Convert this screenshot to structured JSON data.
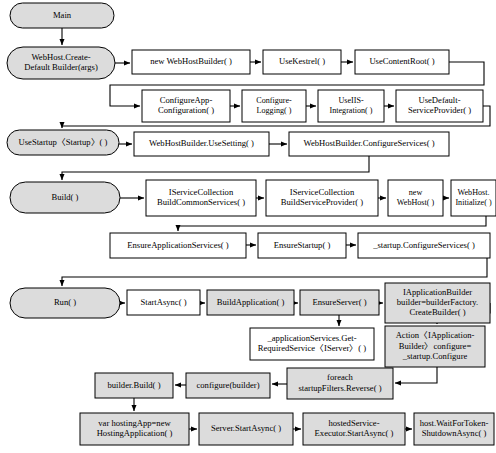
{
  "diagram": {
    "type": "flowchart",
    "colors": {
      "round_node_fill": "#dcdcdc",
      "rect_node_fill": "#ffffff",
      "highlight_node_fill": "#dcdcdc",
      "stroke": "#000000",
      "background": "#ffffff"
    },
    "nodes": [
      {
        "id": "main",
        "label": "Main",
        "shape": "rounded",
        "fill": "grey",
        "x": 10,
        "y": 3,
        "w": 104,
        "h": 25
      },
      {
        "id": "createdefault",
        "label": "WebHost.Create-\nDefault Builder(args)",
        "shape": "rounded",
        "fill": "grey",
        "x": 7,
        "y": 47,
        "w": 108,
        "h": 32
      },
      {
        "id": "usestartup",
        "label": "UseStartup〈Startup〉( )",
        "shape": "rounded",
        "fill": "grey",
        "x": 7,
        "y": 130,
        "w": 112,
        "h": 25
      },
      {
        "id": "build",
        "label": "Build( )",
        "shape": "rounded",
        "fill": "grey",
        "x": 10,
        "y": 182,
        "w": 110,
        "h": 31
      },
      {
        "id": "run",
        "label": "Run( )",
        "shape": "rounded",
        "fill": "grey",
        "x": 10,
        "y": 288,
        "w": 110,
        "h": 30
      },
      {
        "id": "newbuilder",
        "label": "new WebHostBuilder( )",
        "shape": "rect",
        "fill": "white",
        "x": 132,
        "y": 50,
        "w": 118,
        "h": 24
      },
      {
        "id": "usekestrel",
        "label": "UseKestrel( )",
        "shape": "rect",
        "fill": "white",
        "x": 263,
        "y": 50,
        "w": 78,
        "h": 24
      },
      {
        "id": "usecontentroot",
        "label": "UseContentRoot( )",
        "shape": "rect",
        "fill": "white",
        "x": 355,
        "y": 50,
        "w": 94,
        "h": 24
      },
      {
        "id": "configureapp",
        "label": "ConfigureApp-\nConfiguration( )",
        "shape": "rect",
        "fill": "white",
        "x": 142,
        "y": 90,
        "w": 88,
        "h": 32
      },
      {
        "id": "configurelog",
        "label": "Configure-\nLogging( )",
        "shape": "rect",
        "fill": "white",
        "x": 242,
        "y": 90,
        "w": 64,
        "h": 32
      },
      {
        "id": "useiis",
        "label": "UseIIS-\nIntegration( )",
        "shape": "rect",
        "fill": "white",
        "x": 318,
        "y": 90,
        "w": 66,
        "h": 32
      },
      {
        "id": "usedefaultsp",
        "label": "UseDefault-\nServiceProvider( )",
        "shape": "rect",
        "fill": "white",
        "x": 396,
        "y": 90,
        "w": 87,
        "h": 32
      },
      {
        "id": "usesetting",
        "label": "WebHostBuilder.UseSetting( )",
        "shape": "rect",
        "fill": "white",
        "x": 134,
        "y": 132,
        "w": 135,
        "h": 24
      },
      {
        "id": "bconfigureserv",
        "label": "WebHostBuilder.ConfigureServices( )",
        "shape": "rect",
        "fill": "white",
        "x": 289,
        "y": 132,
        "w": 160,
        "h": 24
      },
      {
        "id": "buildcommon",
        "label": "IServiceCollection\nBuildCommonServices( )",
        "shape": "rect",
        "fill": "white",
        "x": 146,
        "y": 180,
        "w": 110,
        "h": 36
      },
      {
        "id": "buildsp",
        "label": "IServiceCollection\nBuildServiceProvider( )",
        "shape": "rect",
        "fill": "white",
        "x": 266,
        "y": 180,
        "w": 112,
        "h": 36
      },
      {
        "id": "newwebhost",
        "label": "new\nWebHost( )",
        "shape": "rect",
        "fill": "white",
        "x": 388,
        "y": 180,
        "w": 55,
        "h": 36
      },
      {
        "id": "webhostinit",
        "label": "WebHost.\nInitialize( )",
        "shape": "rect",
        "fill": "white",
        "x": 451,
        "y": 180,
        "w": 45,
        "h": 36
      },
      {
        "id": "ensureappserv",
        "label": "EnsureApplicationServices( )",
        "shape": "rect",
        "fill": "white",
        "x": 110,
        "y": 233,
        "w": 136,
        "h": 25
      },
      {
        "id": "ensurestartup",
        "label": "EnsureStartup( )",
        "shape": "rect",
        "fill": "white",
        "x": 258,
        "y": 233,
        "w": 88,
        "h": 25
      },
      {
        "id": "startupconfserv",
        "label": "_startup.ConfigureServices( )",
        "shape": "rect",
        "fill": "white",
        "x": 358,
        "y": 233,
        "w": 132,
        "h": 25
      },
      {
        "id": "startasync",
        "label": "StartAsync( )",
        "shape": "rect",
        "fill": "white",
        "x": 127,
        "y": 290,
        "w": 73,
        "h": 25
      },
      {
        "id": "buildapplication",
        "label": "BuildApplication( )",
        "shape": "rect",
        "fill": "grey",
        "x": 207,
        "y": 290,
        "w": 87,
        "h": 25
      },
      {
        "id": "ensureserver",
        "label": "EnsureServer( )",
        "shape": "rect",
        "fill": "grey",
        "x": 300,
        "y": 290,
        "w": 79,
        "h": 25
      },
      {
        "id": "iappbuilder",
        "label": "IApplicationBuilder\nbuilder=builderFactory.\nCreateBuilder( )",
        "shape": "rect",
        "fill": "grey",
        "x": 385,
        "y": 283,
        "w": 105,
        "h": 40
      },
      {
        "id": "getrequired",
        "label": "_applicationServices.Get-\nRequiredService〈IServer〉( )",
        "shape": "rect",
        "fill": "white",
        "x": 250,
        "y": 328,
        "w": 124,
        "h": 32
      },
      {
        "id": "actionconfigure",
        "label": "Action〈IApplication-\nBuilder〉configure=\n_startup.Configure",
        "shape": "rect",
        "fill": "grey",
        "x": 385,
        "y": 326,
        "w": 100,
        "h": 41
      },
      {
        "id": "builderbuild",
        "label": "builder.Build( )",
        "shape": "rect",
        "fill": "grey",
        "x": 95,
        "y": 373,
        "w": 78,
        "h": 25
      },
      {
        "id": "configurebuilder",
        "label": "configure(builder)",
        "shape": "rect",
        "fill": "grey",
        "x": 186,
        "y": 373,
        "w": 84,
        "h": 25
      },
      {
        "id": "foreachfilters",
        "label": "foreach\nstartupFilters.Reverse( )",
        "shape": "rect",
        "fill": "grey",
        "x": 287,
        "y": 368,
        "w": 106,
        "h": 31
      },
      {
        "id": "varhostingapp",
        "label": "var hostingApp=new\nHostingApplication( )",
        "shape": "rect",
        "fill": "grey",
        "x": 80,
        "y": 413,
        "w": 109,
        "h": 32
      },
      {
        "id": "serverstart",
        "label": "Server.StartAsync( )",
        "shape": "rect",
        "fill": "grey",
        "x": 199,
        "y": 413,
        "w": 94,
        "h": 32
      },
      {
        "id": "hostedservice",
        "label": "hostedService-\nExecutor.StartAsync( )",
        "shape": "rect",
        "fill": "grey",
        "x": 303,
        "y": 413,
        "w": 102,
        "h": 32
      },
      {
        "id": "waitfortoken",
        "label": "host.WaitForToken-\nShutdownAsync( )",
        "shape": "rect",
        "fill": "grey",
        "x": 414,
        "y": 413,
        "w": 80,
        "h": 32
      }
    ],
    "edges": [
      {
        "from": "main",
        "to": "createdefault",
        "path": "M 62,28 L 62,45",
        "arrow": "down"
      },
      {
        "from": "createdefault",
        "to": "newbuilder",
        "path": "M 115,63 L 130,63",
        "arrow": "right"
      },
      {
        "from": "newbuilder",
        "to": "usekestrel",
        "path": "M 250,62 L 261,62",
        "arrow": "right"
      },
      {
        "from": "usekestrel",
        "to": "usecontentroot",
        "path": "M 341,62 L 353,62",
        "arrow": "right"
      },
      {
        "from": "usecontentroot",
        "to": "configureapp",
        "path": "M 449,62 L 484,62 L 484,85 L 110,85 L 110,106 L 140,106",
        "arrow": "right"
      },
      {
        "from": "configureapp",
        "to": "configurelog",
        "path": "M 230,106 L 240,106",
        "arrow": "right"
      },
      {
        "from": "configurelog",
        "to": "useiis",
        "path": "M 306,106 L 316,106",
        "arrow": "right"
      },
      {
        "from": "useiis",
        "to": "usedefaultsp",
        "path": "M 384,106 L 394,106",
        "arrow": "right"
      },
      {
        "from": "usedefaultsp",
        "to": "usestartup",
        "path": "M 483,106 L 490,106 L 490,126 L 62,126 L 62,128",
        "arrow": "down"
      },
      {
        "from": "usestartup",
        "to": "usesetting",
        "path": "M 119,144 L 132,144",
        "arrow": "right"
      },
      {
        "from": "usesetting",
        "to": "bconfigureserv",
        "path": "M 269,144 L 287,144",
        "arrow": "right"
      },
      {
        "from": "bconfigureserv",
        "to": "build",
        "path": "M 369,156 L 369,172 L 62,172 L 62,180",
        "arrow": "down"
      },
      {
        "from": "build",
        "to": "buildcommon",
        "path": "M 120,198 L 144,198",
        "arrow": "right"
      },
      {
        "from": "buildcommon",
        "to": "buildsp",
        "path": "M 256,198 L 264,198",
        "arrow": "right"
      },
      {
        "from": "buildsp",
        "to": "newwebhost",
        "path": "M 378,198 L 386,198",
        "arrow": "right"
      },
      {
        "from": "newwebhost",
        "to": "webhostinit",
        "path": "M 443,198 L 449,198",
        "arrow": "right"
      },
      {
        "from": "webhostinit",
        "to": "ensureappserv",
        "path": "M 486,216 L 486,226 L 178,226 L 178,231",
        "arrow": "down"
      },
      {
        "from": "ensureappserv",
        "to": "ensurestartup",
        "path": "M 246,245 L 256,245",
        "arrow": "right"
      },
      {
        "from": "ensurestartup",
        "to": "startupconfserv",
        "path": "M 346,245 L 356,245",
        "arrow": "right"
      },
      {
        "from": "startupconfserv",
        "to": "run",
        "path": "M 487,258 L 487,277 L 62,277 L 62,286",
        "arrow": "down"
      },
      {
        "from": "run",
        "to": "startasync",
        "path": "M 120,303 L 125,303",
        "arrow": "right"
      },
      {
        "from": "startasync",
        "to": "buildapplication",
        "path": "M 200,303 L 205,303",
        "arrow": "right"
      },
      {
        "from": "buildapplication",
        "to": "ensureserver",
        "path": "M 294,303 L 298,303",
        "arrow": "right"
      },
      {
        "from": "ensureserver",
        "to": "iappbuilder",
        "path": "M 379,303 L 383,303",
        "arrow": "right"
      },
      {
        "from": "ensureserver",
        "to": "getrequired",
        "path": "M 339,315 L 339,326",
        "arrow": "down"
      },
      {
        "from": "iappbuilder",
        "to": "actionconfigure",
        "path": "M 490,303 L 490,313 L 437,313 L 437,324",
        "arrow": "down"
      },
      {
        "from": "actionconfigure",
        "to": "foreachfilters",
        "path": "M 437,367 L 437,383 L 395,383",
        "arrow": "left"
      },
      {
        "from": "foreachfilters",
        "to": "configurebuilder",
        "path": "M 287,384 L 272,384",
        "arrow": "left"
      },
      {
        "from": "configurebuilder",
        "to": "builderbuild",
        "path": "M 186,385 L 175,385",
        "arrow": "left"
      },
      {
        "from": "builderbuild",
        "to": "varhostingapp",
        "path": "M 134,398 L 134,411",
        "arrow": "down"
      },
      {
        "from": "varhostingapp",
        "to": "serverstart",
        "path": "M 189,429 L 197,429",
        "arrow": "right"
      },
      {
        "from": "serverstart",
        "to": "hostedservice",
        "path": "M 293,429 L 301,429",
        "arrow": "right"
      },
      {
        "from": "hostedservice",
        "to": "waitfortoken",
        "path": "M 405,429 L 412,429",
        "arrow": "right"
      }
    ]
  }
}
